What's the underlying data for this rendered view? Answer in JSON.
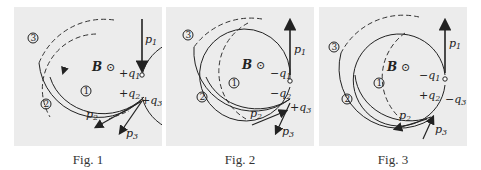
{
  "figures": [
    {
      "caption": "Fig. 1",
      "field": "B",
      "charges": {
        "q1": "+q1",
        "q2": "+q2",
        "q3": "+q3"
      },
      "p1_direction": "down",
      "p3_direction": "out",
      "orbit_direction": "ccw"
    },
    {
      "caption": "Fig. 2",
      "field": "B",
      "charges": {
        "q1": "-q1",
        "q2": "-q2",
        "q3": "+q3"
      },
      "p1_direction": "up",
      "p3_direction": "out",
      "orbit_direction": "cw"
    },
    {
      "caption": "Fig. 3",
      "field": "B",
      "charges": {
        "q1": "-q1",
        "q2": "+q2",
        "q3": "-q3"
      },
      "p1_direction": "up",
      "p3_direction": "in",
      "orbit_direction": "mixed"
    }
  ],
  "labels": {
    "p1": "p",
    "p1_sub": "1",
    "p2": "p",
    "p2_sub": "2",
    "p3": "p",
    "p3_sub": "3",
    "track1": "1",
    "track2": "2",
    "track3": "3",
    "field_symbol": "⊙"
  }
}
